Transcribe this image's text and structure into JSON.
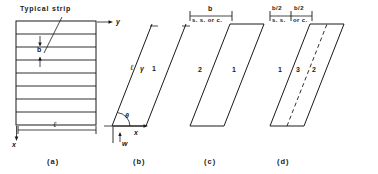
{
  "figure": {
    "panels": [
      {
        "id": "a",
        "caption": "(a)",
        "labels": {
          "typical_strip": "Typical strip",
          "strip_width": "b",
          "length": "ℓ",
          "axis_y": "y",
          "axis_x": "x"
        },
        "strip_count": 8
      },
      {
        "id": "b",
        "caption": "(b)",
        "labels": {
          "length": "ℓ",
          "gamma": "γ",
          "edge_1": "1",
          "angle": "θ",
          "axis_x": "x",
          "axis_y": "y",
          "load": "w"
        }
      },
      {
        "id": "c",
        "caption": "(c)",
        "labels": {
          "width": "b",
          "support": "s. s. or c.",
          "edge_1": "1",
          "edge_2": "2"
        }
      },
      {
        "id": "d",
        "caption": "(d)",
        "labels": {
          "width_left": "b/2",
          "width_right": "b/2",
          "support_left": "s. s.",
          "support_right": "or c.",
          "edge_1": "1",
          "edge_2": "2",
          "edge_3": "3"
        }
      }
    ],
    "colors": {
      "ink": "#1a1a1a",
      "background": "#ffffff"
    }
  }
}
